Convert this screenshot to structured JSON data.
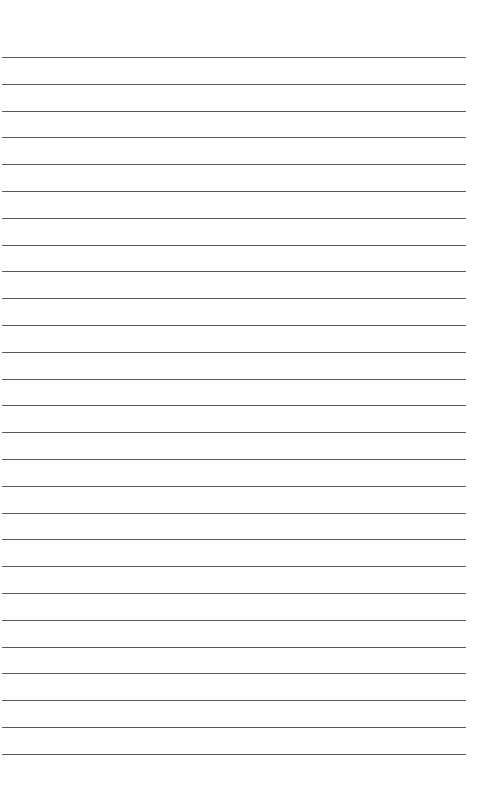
{
  "page": {
    "type": "lined-paper",
    "background": "#ffffff",
    "line_color": "#5a5a5a",
    "line_count": 27,
    "first_line_y": 57,
    "line_spacing": 26.8,
    "line_left": 2,
    "line_right": 466
  }
}
